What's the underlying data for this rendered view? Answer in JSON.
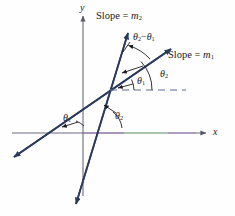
{
  "figure": {
    "background": "#fefefe"
  },
  "axes": {
    "x_label": "x",
    "y_label": "y",
    "axis_color": "#6b6b7a",
    "x_tint_color": "#9fd6a0",
    "x_tint2_color": "#b08fc0",
    "origin": {
      "x": 83,
      "y": 133
    }
  },
  "lines": [
    {
      "name": "line-m1",
      "label_prefix": "Slope = ",
      "label_symbol": "m",
      "label_sub": "1",
      "color": "#2a3a5c",
      "x1": 14,
      "y1": 157,
      "x2": 171,
      "y2": 49
    },
    {
      "name": "line-m2",
      "label_prefix": "Slope = ",
      "label_symbol": "m",
      "label_sub": "2",
      "color": "#2a3a5c",
      "x1": 76,
      "y1": 204,
      "x2": 128,
      "y2": 33
    }
  ],
  "dashed_line": {
    "name": "horizontal-reference-dashed",
    "color": "#5b6b92",
    "x1": 110,
    "y1": 90,
    "x2": 186,
    "y2": 90
  },
  "intersection": {
    "x": 110,
    "y": 90
  },
  "angles": [
    {
      "name": "theta1-at-intersection",
      "symbol": "θ",
      "sub": "1",
      "label_x": 137,
      "label_y": 80,
      "description": "angle of line m1 above the dashed horizontal at the intersection"
    },
    {
      "name": "theta2-at-intersection",
      "symbol": "θ",
      "sub": "2",
      "label_x": 160,
      "label_y": 73,
      "description": "angle of line m2 above the dashed horizontal at the intersection"
    },
    {
      "name": "theta2-minus-theta1",
      "symbol": "θ",
      "sub": "2",
      "operator": "−",
      "symbol2": "θ",
      "sub2": "1",
      "label_x": 133,
      "label_y": 36,
      "description": "angle between the two lines above the intersection"
    },
    {
      "name": "theta1-at-x-axis",
      "symbol": "θ",
      "sub": "1",
      "label_x": 68,
      "label_y": 118,
      "description": "inclination angle of line m1 with the x-axis"
    },
    {
      "name": "theta2-at-x-axis",
      "symbol": "θ",
      "sub": "2",
      "label_x": 116,
      "label_y": 115,
      "description": "inclination angle of line m2 with the x-axis"
    }
  ],
  "slope_labels": [
    {
      "name": "slope-m2-label",
      "x": 96,
      "y": 12,
      "text_prefix": "Slope = ",
      "symbol": "m",
      "sub": "2"
    },
    {
      "name": "slope-m1-label",
      "x": 168,
      "y": 51,
      "text_prefix": "Slope = ",
      "symbol": "m",
      "sub": "1"
    }
  ]
}
